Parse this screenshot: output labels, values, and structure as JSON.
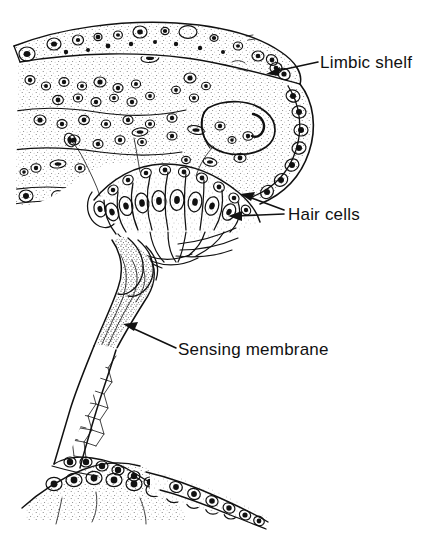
{
  "figure": {
    "domain_kind": "anatomical-line-drawing",
    "background_color": "#ffffff",
    "ink_color": "#111111",
    "stipple_color": "#5a5a5a",
    "width": 439,
    "height": 546
  },
  "annotations": [
    {
      "id": "limbic-shelf",
      "label": "Limbic shelf",
      "text_x": 292,
      "text_y": 68,
      "leaders": [
        {
          "x1": 288,
          "y1": 62,
          "x2": 266,
          "y2": 74
        }
      ]
    },
    {
      "id": "hair-cells",
      "label": "Hair  cells",
      "text_x": 288,
      "text_y": 220,
      "leaders": [
        {
          "x1": 283,
          "y1": 212,
          "x2": 243,
          "y2": 198
        },
        {
          "x1": 283,
          "y1": 214,
          "x2": 230,
          "y2": 214
        }
      ]
    },
    {
      "id": "sensing-membrane",
      "label": "Sensing membrane",
      "text_x": 178,
      "text_y": 355,
      "leaders": [
        {
          "x1": 176,
          "y1": 348,
          "x2": 124,
          "y2": 325
        }
      ]
    }
  ],
  "structures": {
    "limbic_shelf_label": "limbic shelf",
    "hair_cell_count": 8,
    "sensing_membrane_label": "sensing membrane stalk",
    "basal_epithelium_label": "basal epithelial cell row",
    "vacuole_label": "large oval lumen"
  }
}
